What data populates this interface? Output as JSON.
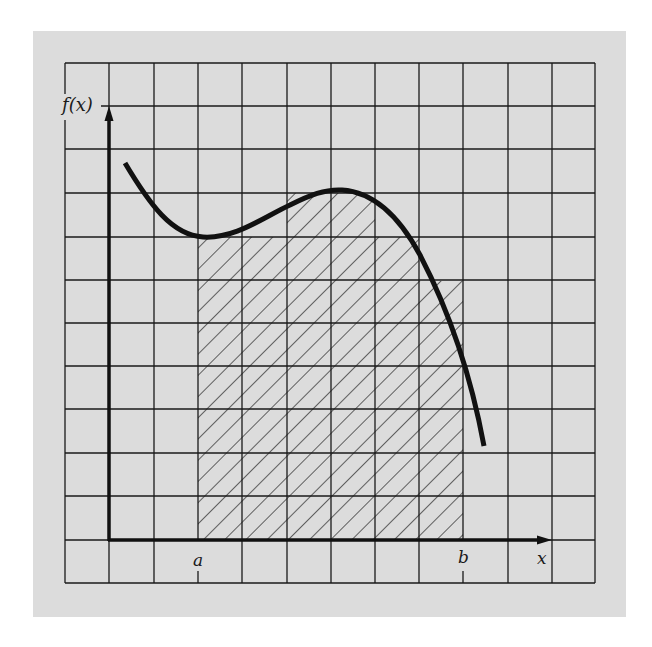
{
  "figure": {
    "background_color": "#dcdcdc",
    "line_color": "#1a1a1a",
    "labels": {
      "y_axis": "f(x)",
      "x_axis": "x",
      "lower_limit": "a",
      "upper_limit": "b"
    },
    "grid": {
      "left": 65,
      "top": 63,
      "right": 595,
      "bottom": 583,
      "columns": 12,
      "rows": 12
    },
    "axes": {
      "origin_x": 109,
      "origin_y": 540,
      "y_arrow_tip": 107,
      "x_arrow_tip": 551
    },
    "limits": {
      "a_x": 198,
      "b_x": 463
    },
    "hatched_steps": [
      {
        "x0": 198,
        "x1": 287,
        "top": 237
      },
      {
        "x0": 287,
        "x1": 375,
        "top": 193
      },
      {
        "x0": 375,
        "x1": 419,
        "top": 237
      },
      {
        "x0": 419,
        "x1": 463,
        "top": 281
      }
    ],
    "curve_description": "Smooth cubic-like curve f(x): starts high at left, dips to local minimum near x=a, rises to local maximum between a and b, then falls steeply past b",
    "caption": ""
  }
}
